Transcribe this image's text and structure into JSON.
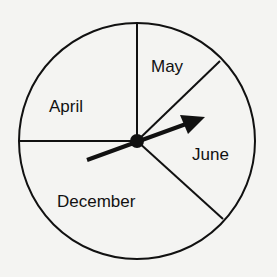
{
  "diagram": {
    "type": "spinner",
    "sections": [
      {
        "label": "April"
      },
      {
        "label": "May"
      },
      {
        "label": "June"
      },
      {
        "label": "December"
      }
    ],
    "pointer": "arrow pointing into June section",
    "colors": {
      "line": "#111111",
      "background": "#f4f4f2"
    }
  }
}
